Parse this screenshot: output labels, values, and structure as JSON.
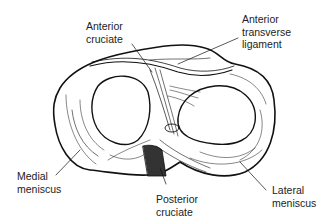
{
  "diagram": {
    "labels": {
      "anterior_cruciate": [
        "Anterior",
        "cruciate"
      ],
      "anterior_transverse_ligament": [
        "Anterior",
        "transverse",
        "ligament"
      ],
      "medial_meniscus": [
        "Medial",
        "meniscus"
      ],
      "posterior_cruciate": [
        "Posterior",
        "cruciate"
      ],
      "lateral_meniscus": [
        "Lateral",
        "meniscus"
      ]
    }
  }
}
